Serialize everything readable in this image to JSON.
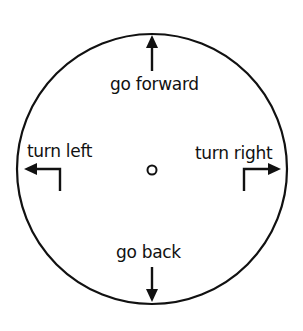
{
  "diagram": {
    "type": "direction-dial",
    "center_marker": "small-circle",
    "colors": {
      "stroke": "#111111",
      "background": "#ffffff"
    },
    "directions": [
      {
        "id": "forward",
        "label": "go forward",
        "arrow": "up"
      },
      {
        "id": "left",
        "label": "turn left",
        "arrow": "bent-left"
      },
      {
        "id": "right",
        "label": "turn right",
        "arrow": "bent-right"
      },
      {
        "id": "back",
        "label": "go back",
        "arrow": "down"
      }
    ]
  }
}
